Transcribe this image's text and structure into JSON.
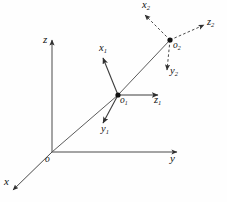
{
  "figure": {
    "type": "coordinate-frame-diagram",
    "background_color": "#fefefe",
    "line_color": "#4a4a4a",
    "width": 227,
    "height": 202,
    "caption": "",
    "world_frame": {
      "origin_label": "o",
      "origin_point": [
        52,
        152
      ],
      "axes": [
        {
          "name": "z-axis",
          "label": "z",
          "subscript": "",
          "tip": [
            52,
            38
          ],
          "label_pos": [
            43,
            36
          ],
          "style": "solid"
        },
        {
          "name": "y-axis",
          "label": "y",
          "subscript": "",
          "tip": [
            179,
            152
          ],
          "label_pos": [
            170,
            154
          ],
          "style": "solid"
        },
        {
          "name": "x-axis",
          "label": "x",
          "subscript": "",
          "tip": [
            11,
            192
          ],
          "label_pos": [
            5,
            177
          ],
          "style": "solid"
        }
      ]
    },
    "frame_1": {
      "origin_label": "o",
      "origin_subscript": "1",
      "origin_point": [
        118,
        95
      ],
      "origin_label_pos": [
        121,
        97
      ],
      "axes": [
        {
          "name": "x1-axis",
          "label": "x",
          "subscript": "1",
          "tip": [
            102,
            56
          ],
          "label_pos": [
            99,
            44
          ],
          "style": "solid"
        },
        {
          "name": "y1-axis",
          "label": "y",
          "subscript": "1",
          "tip": [
            102,
            125
          ],
          "label_pos": [
            102,
            126
          ],
          "style": "solid"
        },
        {
          "name": "z1-axis",
          "label": "z",
          "subscript": "1",
          "tip": [
            160,
            95
          ],
          "label_pos": [
            155,
            97
          ],
          "style": "solid"
        }
      ]
    },
    "frame_2": {
      "origin_label": "o",
      "origin_subscript": "2",
      "origin_point": [
        170,
        40
      ],
      "origin_label_pos": [
        174,
        42
      ],
      "axes": [
        {
          "name": "x2-axis",
          "label": "x",
          "subscript": "2",
          "tip": [
            143,
            13
          ],
          "label_pos": [
            143,
            1
          ],
          "style": "dashed"
        },
        {
          "name": "y2-axis",
          "label": "y",
          "subscript": "2",
          "tip": [
            167,
            72
          ],
          "label_pos": [
            169,
            70
          ],
          "style": "dashed"
        },
        {
          "name": "z2-axis",
          "label": "z",
          "subscript": "2",
          "tip": [
            206,
            24
          ],
          "label_pos": [
            208,
            18
          ],
          "style": "dashed"
        }
      ]
    },
    "connector": {
      "name": "origin-chain",
      "points": [
        [
          52,
          152
        ],
        [
          118,
          95
        ],
        [
          170,
          40
        ]
      ],
      "style": "solid"
    }
  }
}
